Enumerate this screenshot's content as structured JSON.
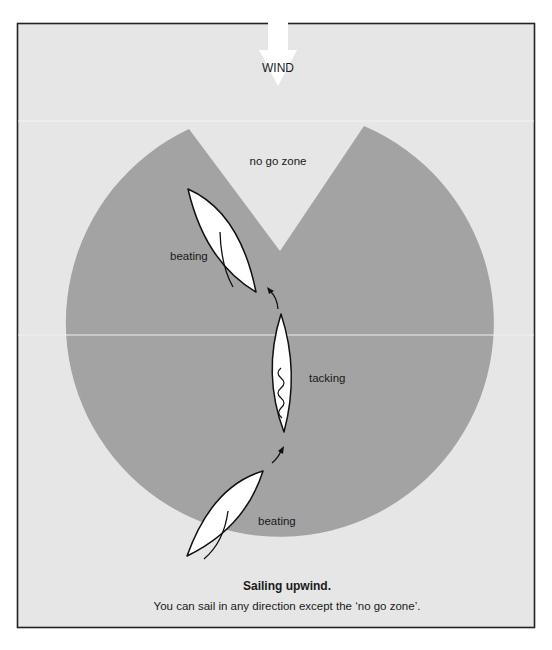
{
  "diagram": {
    "title": "Sailing upwind.",
    "caption": "You can sail in any direction except the ‘no go zone’.",
    "wind_label": "WIND",
    "zone_label": "no go zone",
    "boats": [
      {
        "id": "upper",
        "state_label": "beating"
      },
      {
        "id": "middle",
        "state_label": "tacking"
      },
      {
        "id": "lower",
        "state_label": "beating"
      }
    ],
    "icons": {
      "wind": "wind-arrow-down-icon",
      "course": "curved-arrow-icon",
      "luffing_sail": "wavy-sail-icon"
    },
    "colors": {
      "page_background": "#ffffff",
      "panel_background": "#e6e6e6",
      "sailable_zone": "#a3a3a3",
      "no_go_zone": "#e6e6e6",
      "boat_fill": "#ffffff",
      "outline": "#111111",
      "wind_arrow": "#ffffff"
    }
  }
}
